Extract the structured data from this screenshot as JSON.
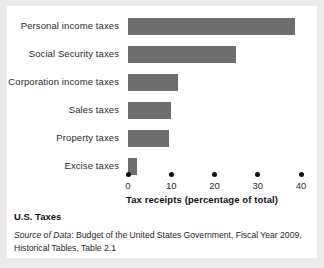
{
  "chart_data": {
    "type": "bar",
    "orientation": "horizontal",
    "title": "",
    "xlabel": "Tax receipts (percentage of total)",
    "ylabel": "",
    "xlim": [
      0,
      40
    ],
    "xticks": [
      0,
      10,
      20,
      30,
      40
    ],
    "xtick_labels": [
      "0",
      "10",
      "20",
      "30",
      "40"
    ],
    "grid": false,
    "legend": false,
    "bar_color": "#6e6e6e",
    "categories": [
      "Personal income taxes",
      "Social Security taxes",
      "Corporation income taxes",
      "Sales taxes",
      "Property taxes",
      "Excise taxes"
    ],
    "values": [
      38.5,
      25.0,
      11.5,
      10.0,
      9.5,
      2.0
    ],
    "bars": [
      {
        "label": "Personal income taxes",
        "value": 38.5
      },
      {
        "label": "Social Security taxes",
        "value": 25.0
      },
      {
        "label": "Corporation income taxes",
        "value": 11.5
      },
      {
        "label": "Sales taxes",
        "value": 10.0
      },
      {
        "label": "Property taxes",
        "value": 9.5
      },
      {
        "label": "Excise taxes",
        "value": 2.0
      }
    ]
  },
  "caption": {
    "title": "U.S. Taxes",
    "source_label": "Source of Data",
    "source_separator": ": ",
    "source_text": "Budget of the United States Government, Fiscal Year 2009, Historical Tables, Table 2.1"
  },
  "colors": {
    "page_background": "#eceaea",
    "panel_background": "#ffffff",
    "bar": "#6e6e6e",
    "text": "#1f1f1f",
    "tick": "#111111"
  }
}
